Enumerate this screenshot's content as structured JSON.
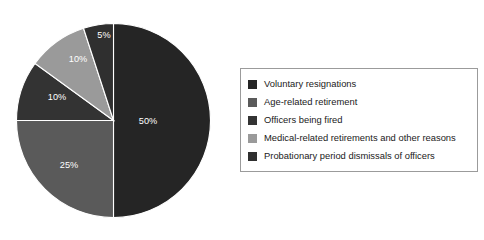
{
  "chart_data": {
    "type": "pie",
    "title": "",
    "subtitle": "",
    "xlabel": "",
    "ylabel": "",
    "grid": false,
    "legend_position": "right",
    "start_angle_deg": 0,
    "direction": "clockwise",
    "categories": [
      "Voluntary resignations",
      "Age-related retirement",
      "Officers being fired",
      "Medical-related retirements and other reasons",
      "Probationary period dismissals of officers"
    ],
    "values": [
      50,
      25,
      10,
      10,
      5
    ],
    "value_labels": [
      "50%",
      "25%",
      "10%",
      "10%",
      "5%"
    ],
    "colors": [
      "#252525",
      "#5a5a5a",
      "#333333",
      "#9a9a9a",
      "#2f2f2f"
    ],
    "slices": [
      {
        "label": "Voluntary resignations",
        "value": 50,
        "value_label": "50%",
        "color": "#252525",
        "label_x": 148,
        "label_y": 122
      },
      {
        "label": "Age-related retirement",
        "value": 25,
        "value_label": "25%",
        "color": "#5a5a5a",
        "label_x": 69,
        "label_y": 166
      },
      {
        "label": "Officers being fired",
        "value": 10,
        "value_label": "10%",
        "color": "#333333",
        "label_x": 57,
        "label_y": 98
      },
      {
        "label": "Medical-related retirements and other reasons",
        "value": 10,
        "value_label": "10%",
        "color": "#9a9a9a",
        "label_x": 78,
        "label_y": 60
      },
      {
        "label": "Probationary period dismissals of officers",
        "value": 5,
        "value_label": "5%",
        "color": "#2f2f2f",
        "label_x": 104,
        "label_y": 36
      }
    ]
  },
  "legend": {
    "items": [
      {
        "label": "Voluntary resignations",
        "color": "#252525"
      },
      {
        "label": "Age-related retirement",
        "color": "#5a5a5a"
      },
      {
        "label": "Officers being fired",
        "color": "#333333"
      },
      {
        "label": "Medical-related retirements and other reasons",
        "color": "#9a9a9a"
      },
      {
        "label": "Probationary period dismissals of officers",
        "color": "#2f2f2f"
      }
    ]
  },
  "style": {
    "background": "#ffffff",
    "label_color": "#ffffff",
    "legend_border": "#9b9b9b",
    "legend_text_color": "#1a1a1a"
  }
}
